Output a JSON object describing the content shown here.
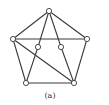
{
  "caption": "(a)",
  "colors": {
    "edge": "#3a3a3a",
    "node_fill": "#ffffff",
    "background": "#ffffff"
  },
  "graph": {
    "nodes": [
      {
        "id": "top",
        "x": 49,
        "y": 11
      },
      {
        "id": "left",
        "x": 13,
        "y": 39
      },
      {
        "id": "right",
        "x": 87,
        "y": 39
      },
      {
        "id": "inner-left",
        "x": 38,
        "y": 47
      },
      {
        "id": "inner-right",
        "x": 61,
        "y": 47
      },
      {
        "id": "bottom-left",
        "x": 26,
        "y": 83
      },
      {
        "id": "bottom-right",
        "x": 74,
        "y": 83
      }
    ],
    "edges": [
      [
        "top",
        "left"
      ],
      [
        "top",
        "right"
      ],
      [
        "top",
        "inner-left"
      ],
      [
        "top",
        "inner-right"
      ],
      [
        "left",
        "right"
      ],
      [
        "left",
        "bottom-left"
      ],
      [
        "left",
        "bottom-right"
      ],
      [
        "right",
        "bottom-right"
      ],
      [
        "inner-left",
        "bottom-left"
      ],
      [
        "inner-right",
        "bottom-right"
      ],
      [
        "bottom-left",
        "bottom-right"
      ]
    ]
  }
}
